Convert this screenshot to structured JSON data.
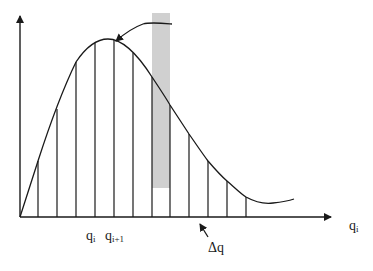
{
  "diagram": {
    "type": "riemann-sum-distribution",
    "labels": {
      "q_i": "q",
      "q_i_sub": "i",
      "q_i1": "q",
      "q_i1_sub": "i+1",
      "delta_q": "Δq",
      "x_axis": "q",
      "x_axis_sub": "i"
    },
    "colors": {
      "line": "#1a1a1a",
      "highlight_bar": "#d0d0d0",
      "background": "#ffffff"
    },
    "axes": {
      "origin": [
        20,
        217
      ],
      "x_end": [
        333,
        217
      ],
      "y_end": [
        20,
        14
      ]
    },
    "strips": [
      {
        "x": 38,
        "top": 161
      },
      {
        "x": 57,
        "top": 109
      },
      {
        "x": 76,
        "top": 62
      },
      {
        "x": 95,
        "top": 43
      },
      {
        "x": 114,
        "top": 40
      },
      {
        "x": 133,
        "top": 53
      },
      {
        "x": 152,
        "top": 77
      },
      {
        "x": 170,
        "top": 105
      },
      {
        "x": 189,
        "top": 134
      },
      {
        "x": 208,
        "top": 161
      },
      {
        "x": 227,
        "top": 181
      },
      {
        "x": 246,
        "top": 197
      }
    ],
    "highlight": {
      "x": 152,
      "y": 13,
      "width": 18,
      "height": 175
    }
  }
}
